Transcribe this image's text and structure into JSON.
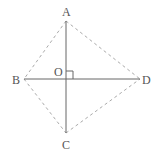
{
  "diagram": {
    "type": "geometry-quadrilateral",
    "points": {
      "A": {
        "label": "A",
        "x": 66,
        "y": 21
      },
      "B": {
        "label": "B",
        "x": 24,
        "y": 79
      },
      "C": {
        "label": "C",
        "x": 66,
        "y": 133
      },
      "D": {
        "label": "D",
        "x": 140,
        "y": 79
      },
      "O": {
        "label": "O",
        "x": 66,
        "y": 79
      }
    },
    "solid_segments": [
      "AC",
      "BD"
    ],
    "dashed_segments": [
      "AB",
      "AD",
      "BC",
      "CD"
    ],
    "right_angle_at": "O",
    "colors": {
      "solid": "#666666",
      "dashed": "#aaaaaa",
      "label": "#555555"
    }
  }
}
